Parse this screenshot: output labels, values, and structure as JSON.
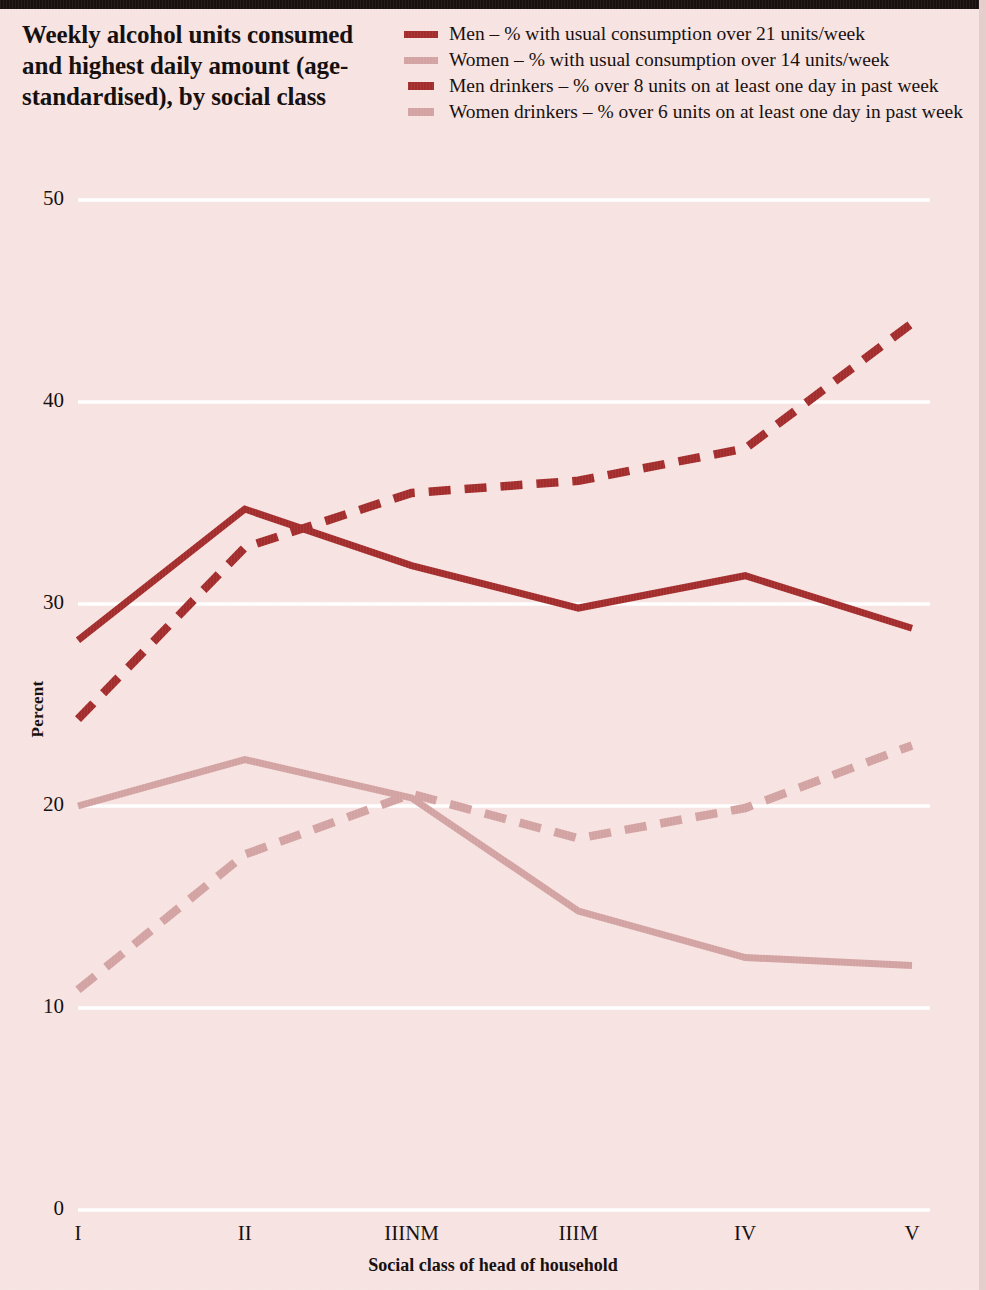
{
  "header": {
    "title": "Weekly alcohol units consumed and highest daily amount (age-standardised), by social class"
  },
  "legend": {
    "items": [
      {
        "label": "Men – % with usual consumption over 21 units/week",
        "style": "solid",
        "color": "#a32c2c",
        "swatch": "solid-dark"
      },
      {
        "label": "Women – % with usual consumption over 14 units/week",
        "style": "solid",
        "color": "#d3a3a3",
        "swatch": "solid-light"
      },
      {
        "label": "Men drinkers – % over 8 units on at least one day in past week",
        "style": "dashed",
        "color": "#a32c2c",
        "swatch": "dash-dark"
      },
      {
        "label": "Women drinkers – % over 6 units on at least one day in past week",
        "style": "dashed",
        "color": "#d3a3a3",
        "swatch": "dash-light"
      }
    ]
  },
  "axes": {
    "y_title": "Percent",
    "x_title": "Social class of head of household",
    "y_ticks": [
      "0",
      "10",
      "20",
      "30",
      "40",
      "50"
    ],
    "x_ticks": [
      "I",
      "II",
      "IIINM",
      "IIIM",
      "IV",
      "V"
    ]
  },
  "colors": {
    "background": "#f7e3e1",
    "dark_red": "#a32c2c",
    "light_pink": "#d3a3a3",
    "gridline": "#ffffff",
    "text": "#140d0c",
    "top_rule": "#17100f"
  },
  "chart_data": {
    "type": "line",
    "title": "Weekly alcohol units consumed and highest daily amount (age-standardised), by social class",
    "xlabel": "Social class of head of household",
    "ylabel": "Percent",
    "categories": [
      "I",
      "II",
      "IIINM",
      "IIIM",
      "IV",
      "V"
    ],
    "ylim": [
      0,
      50
    ],
    "yticks": [
      0,
      10,
      20,
      30,
      40,
      50
    ],
    "grid": "horizontal",
    "legend_position": "top-right",
    "series": [
      {
        "name": "Men – % with usual consumption over 21 units/week",
        "style": "solid",
        "color": "#a32c2c",
        "values": [
          28.2,
          34.7,
          31.9,
          29.8,
          31.4,
          28.8
        ]
      },
      {
        "name": "Women – % with usual consumption over 14 units/week",
        "style": "solid",
        "color": "#d3a3a3",
        "values": [
          20.0,
          22.3,
          20.4,
          14.8,
          12.5,
          12.1
        ]
      },
      {
        "name": "Men drinkers – % over 8 units on at least one day in past week",
        "style": "dashed",
        "color": "#a32c2c",
        "values": [
          24.3,
          32.8,
          35.5,
          36.1,
          37.7,
          43.9
        ]
      },
      {
        "name": "Women drinkers – % over 6 units on at least one day in past week",
        "style": "dashed",
        "color": "#d3a3a3",
        "values": [
          10.9,
          17.6,
          20.6,
          18.4,
          19.9,
          23.0
        ]
      }
    ]
  }
}
